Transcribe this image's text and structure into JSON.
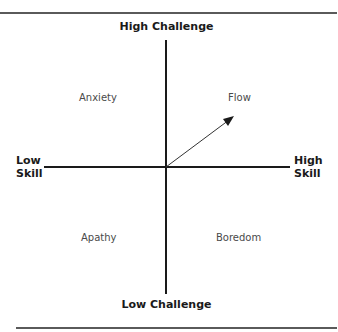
{
  "diagram": {
    "type": "quadrant",
    "axes": {
      "vertical": {
        "top": "High Challenge",
        "bottom": "Low Challenge"
      },
      "horizontal": {
        "left_line1": "Low",
        "left_line2": "Skill",
        "right_line1": "High",
        "right_line2": "Skill"
      }
    },
    "quadrants": {
      "top_left": "Anxiety",
      "top_right": "Flow",
      "bottom_left": "Apathy",
      "bottom_right": "Boredom"
    },
    "arrow": {
      "from": "origin",
      "to": "Flow",
      "icon": "arrow-icon"
    },
    "colors": {
      "line": "#1a1a1a",
      "rule": "#5a5a5a",
      "text": "#1a1a1a",
      "quadrant_text": "#4a4a4a"
    }
  }
}
